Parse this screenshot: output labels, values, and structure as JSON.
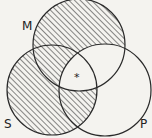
{
  "diagram": {
    "type": "venn-3",
    "circles": [
      {
        "id": "M",
        "label": "M",
        "cx": 79,
        "cy": 45,
        "r": 46
      },
      {
        "id": "S",
        "label": "S",
        "cx": 52,
        "cy": 90,
        "r": 45
      },
      {
        "id": "P",
        "label": "P",
        "cx": 105,
        "cy": 90,
        "r": 46
      }
    ],
    "shaded_regions": [
      "M only",
      "M∩S not P",
      "S only",
      "S∩P not M"
    ],
    "unshaded_regions": [
      "M∩P not S",
      "P only",
      "M∩S∩P"
    ],
    "center_marker": "*",
    "colors": {
      "stroke": "#2a2a2a",
      "hatch": "#3a3a3a",
      "background": "#f4f3ef"
    }
  }
}
